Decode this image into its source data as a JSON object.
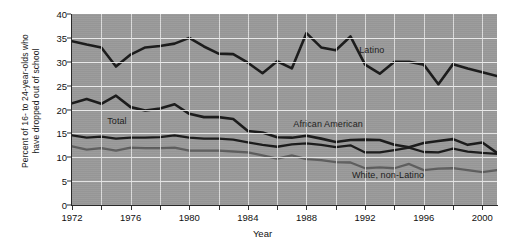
{
  "chart_data": {
    "type": "line",
    "title": "",
    "xlabel": "Year",
    "ylabel_line1": "Percent of 16- to 24-year-olds who",
    "ylabel_line2": "have dropped out of school",
    "xlim": [
      1972,
      2001
    ],
    "ylim": [
      0,
      40
    ],
    "ytick_step": 5,
    "yticks": [
      0,
      5,
      10,
      15,
      20,
      25,
      30,
      35,
      40
    ],
    "xticks_major": [
      1972,
      1976,
      1980,
      1984,
      1988,
      1992,
      1996,
      2000
    ],
    "xtick_interval": 2,
    "grid": "both",
    "legend": "inline-labels",
    "plot_background": "#9a9a9a",
    "x": [
      1972,
      1973,
      1974,
      1975,
      1976,
      1977,
      1978,
      1979,
      1980,
      1981,
      1982,
      1983,
      1984,
      1985,
      1986,
      1987,
      1988,
      1989,
      1990,
      1991,
      1992,
      1993,
      1994,
      1995,
      1996,
      1997,
      1998,
      1999,
      2000,
      2001
    ],
    "series": [
      {
        "name": "Latino",
        "color": "#1a1a1a",
        "width": 2.6,
        "label_x": 1991.6,
        "label_y": 32.2,
        "values": [
          34.3,
          33.6,
          33.0,
          29.0,
          31.5,
          33.0,
          33.3,
          33.8,
          35.0,
          33.2,
          31.7,
          31.6,
          29.8,
          27.6,
          30.1,
          28.6,
          36.0,
          33.0,
          32.4,
          35.3,
          29.4,
          27.5,
          30.0,
          30.0,
          29.4,
          25.3,
          29.5,
          28.6,
          27.8,
          27.0
        ]
      },
      {
        "name": "African American",
        "color": "#1a1a1a",
        "width": 2.6,
        "label_x": 1987.1,
        "label_y": 16.8,
        "values": [
          21.3,
          22.2,
          21.2,
          22.9,
          20.5,
          19.8,
          20.2,
          21.1,
          19.1,
          18.4,
          18.4,
          18.0,
          15.5,
          15.2,
          14.2,
          14.1,
          14.5,
          13.9,
          13.2,
          13.6,
          13.7,
          13.6,
          12.6,
          12.1,
          13.0,
          13.4,
          13.8,
          12.6,
          13.1,
          10.9
        ]
      },
      {
        "name": "Total",
        "color": "#1a1a1a",
        "width": 2.3,
        "label_x": 1974.4,
        "label_y": 17.3,
        "values": [
          14.6,
          14.1,
          14.3,
          13.9,
          14.1,
          14.1,
          14.2,
          14.6,
          14.1,
          13.9,
          13.9,
          13.7,
          13.1,
          12.6,
          12.2,
          12.7,
          12.9,
          12.6,
          12.1,
          12.5,
          11.0,
          11.0,
          11.5,
          12.0,
          11.1,
          11.0,
          11.8,
          11.2,
          10.9,
          10.7
        ]
      },
      {
        "name": "White, non-Latino",
        "color": "#5e5e5e",
        "width": 2.3,
        "label_x": 1991.1,
        "label_y": 6.1,
        "values": [
          12.3,
          11.6,
          11.9,
          11.4,
          12.0,
          11.9,
          11.9,
          12.0,
          11.4,
          11.4,
          11.4,
          11.2,
          11.0,
          10.4,
          9.7,
          10.4,
          9.6,
          9.4,
          9.0,
          8.9,
          7.7,
          7.9,
          7.7,
          8.6,
          7.3,
          7.6,
          7.7,
          7.3,
          6.9,
          7.3
        ]
      }
    ]
  }
}
